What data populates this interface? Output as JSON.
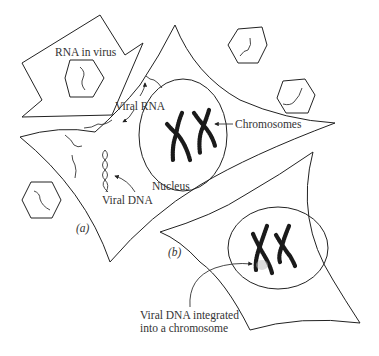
{
  "figure": {
    "labels": {
      "rna_in_virus": "RNA in virus",
      "viral_rna": "Viral RNA",
      "chromosomes": "Chromosomes",
      "nucleus": "Nucleus",
      "viral_dna": "Viral DNA",
      "panel_a": "(a)",
      "panel_b": "(b)",
      "integrated_line1": "Viral DNA integrated",
      "integrated_line2": "into a chromosome"
    },
    "colors": {
      "line": "#222222",
      "background": "#ffffff"
    },
    "elements": {
      "virus_particles": 4,
      "cells": 3,
      "nuclei": 2
    }
  }
}
